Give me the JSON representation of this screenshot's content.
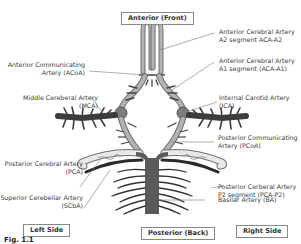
{
  "orientation": {
    "top": "Anterior (Front)",
    "bottom": "Posterior (Back)",
    "left": "Left Side",
    "right": "Right Side"
  },
  "caption": "Fig. 1.1",
  "labels_left": [
    {
      "id": "acoa",
      "line1": "Anterior Communicating",
      "line2": "Artery (ACoA)"
    },
    {
      "id": "mca",
      "line1": "Middle Cereberal Artery",
      "line2": "(MCA)"
    },
    {
      "id": "pca",
      "line1": "Posterior Cerebral Artery",
      "line2": "(PCA)"
    },
    {
      "id": "scba",
      "line1": "Superior Cerebellar Artery",
      "line2": "(SCbA)"
    }
  ],
  "labels_right": [
    {
      "id": "aca-a2",
      "line1": "Anterior Cerebral Artery",
      "line2": "A2 segment ACA-A2"
    },
    {
      "id": "aca-a1",
      "line1": "Anterior Cerebral Artery",
      "line2": "A1 segment (ACA-A1)"
    },
    {
      "id": "ica",
      "line1": "Internal Carotid Artery",
      "line2": "(ICA)"
    },
    {
      "id": "pcoa",
      "line1": "Posterior Communicating",
      "line2": "Artery (PCoA)"
    },
    {
      "id": "pca-p2",
      "line1": "Posterior Cerberal Artery",
      "line2": "P2 segment (PCA-P2)"
    },
    {
      "id": "ba",
      "line1": "Basilar Artery (BA)",
      "line2": ""
    }
  ],
  "colors": {
    "anterior_vessel": "#a9a9a9",
    "anterior_outline": "#6f6f6f",
    "mca_dark": "#3c3c3c",
    "basilar": "#5a5a5a",
    "branches": "#444444",
    "leader_line": "#777777"
  }
}
